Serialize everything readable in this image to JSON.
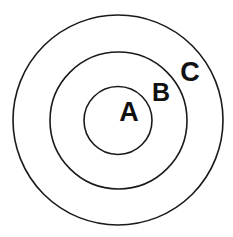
{
  "diagram": {
    "type": "concentric-circles",
    "stroke_color": "#1a1a1a",
    "background": "#ffffff",
    "center": {
      "x": 118,
      "y": 120
    },
    "circles": [
      {
        "id": "A",
        "label": "A",
        "radius": 34,
        "label_x": 129,
        "label_y": 121
      },
      {
        "id": "B",
        "label": "B",
        "radius": 69,
        "label_x": 161,
        "label_y": 101
      },
      {
        "id": "C",
        "label": "C",
        "radius": 105,
        "label_x": 190,
        "label_y": 81
      }
    ]
  }
}
